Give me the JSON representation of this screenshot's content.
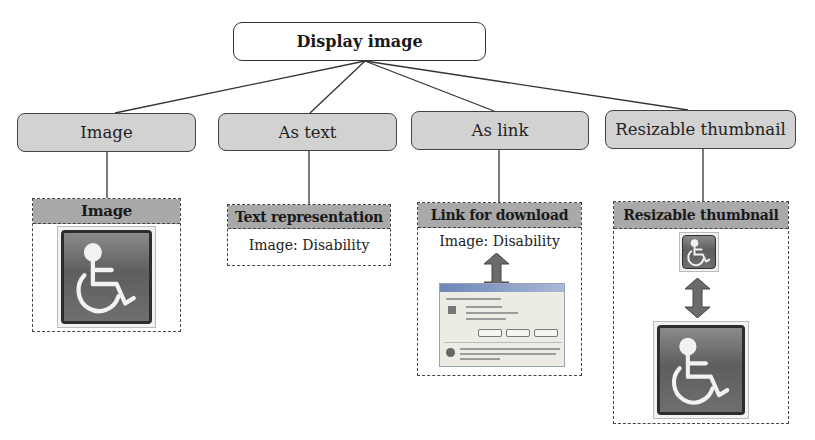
{
  "root": {
    "label": "Display image"
  },
  "categories": [
    {
      "label": "Image"
    },
    {
      "label": "As text"
    },
    {
      "label": "As link"
    },
    {
      "label": "Resizable thumbnail"
    }
  ],
  "panels": {
    "image": {
      "header": "Image",
      "icon": "wheelchair-accessibility-icon"
    },
    "text": {
      "header": "Text representation",
      "content": "Image: Disability"
    },
    "link": {
      "header": "Link for download",
      "content": "Image: Disability",
      "arrow": "double-arrow-vertical-icon",
      "dialog": "file-download-dialog-screenshot"
    },
    "thumbnail": {
      "header": "Resizable thumbnail",
      "small_icon": "wheelchair-accessibility-icon",
      "arrow": "double-arrow-vertical-icon",
      "large_icon": "wheelchair-accessibility-icon"
    }
  },
  "colors": {
    "category_fill": "#d2d2d2",
    "panel_header_fill": "#a9a9a9",
    "arrow_fill": "#6b6b6b",
    "icon_fill": "#6a6a6a",
    "border": "#333333"
  }
}
